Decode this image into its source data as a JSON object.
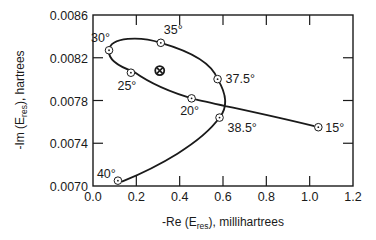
{
  "chart_data": {
    "type": "line",
    "title": "",
    "xlabel": "-Re (E_res), millihartrees",
    "ylabel": "-Im (E_res), hartrees",
    "xlim": [
      0.0,
      1.2
    ],
    "ylim": [
      0.007,
      0.0086
    ],
    "x_ticks": [
      "0.0",
      "0.2",
      "0.4",
      "0.6",
      "0.8",
      "1.0",
      "1.2"
    ],
    "y_ticks": [
      "0.0070",
      "0.0074",
      "0.0078",
      "0.0082",
      "0.0086"
    ],
    "grid": false,
    "series": [
      {
        "name": "complex-rotation trajectory (angle theta)",
        "points": [
          {
            "label": "15°",
            "x": 1.04,
            "y": 0.00755
          },
          {
            "label": "20°",
            "x": 0.455,
            "y": 0.00782
          },
          {
            "label": "25°",
            "x": 0.175,
            "y": 0.00806
          },
          {
            "label": "30°",
            "x": 0.074,
            "y": 0.00827
          },
          {
            "label": "35°",
            "x": 0.313,
            "y": 0.00834
          },
          {
            "label": "37.5°",
            "x": 0.575,
            "y": 0.008
          },
          {
            "label": "38.5°",
            "x": 0.584,
            "y": 0.00764
          },
          {
            "label": "40°",
            "x": 0.115,
            "y": 0.00705
          }
        ]
      }
    ],
    "annotations": [
      {
        "type": "special-marker",
        "symbol": "⊗",
        "x": 0.308,
        "y": 0.00808
      }
    ]
  },
  "axes": {
    "x_title_prefix": "-Re (E",
    "x_title_sub": "res",
    "x_title_suffix": "), millihartrees",
    "y_title_prefix": "-Im (E",
    "y_title_sub": "res",
    "y_title_suffix": "), hartrees"
  }
}
